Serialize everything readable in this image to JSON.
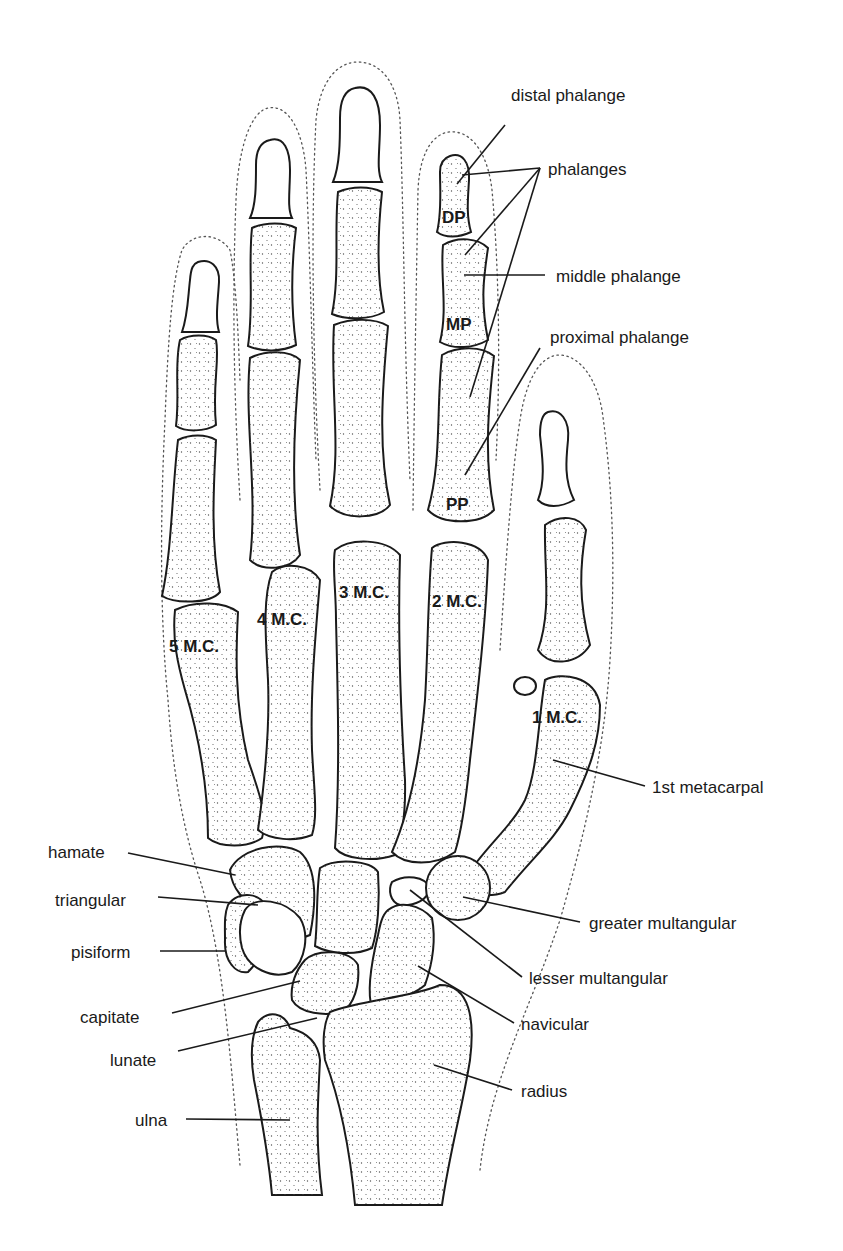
{
  "figure": {
    "ink_color": "#1a1a1a",
    "background": "#ffffff"
  },
  "labels": {
    "distal_phalange": "distal phalange",
    "phalanges": "phalanges",
    "middle_phalange": "middle phalange",
    "proximal_phalange": "proximal phalange",
    "first_metacarpal": "1st metacarpal",
    "hamate": "hamate",
    "triangular": "triangular",
    "pisiform": "pisiform",
    "capitate": "capitate",
    "lunate": "lunate",
    "ulna": "ulna",
    "greater_multangular": "greater multangular",
    "lesser_multangular": "lesser multangular",
    "navicular": "navicular",
    "radius": "radius"
  },
  "bone_labels": {
    "dp": "DP",
    "mp": "MP",
    "pp": "PP",
    "mc1": "1 M.C.",
    "mc2": "2 M.C.",
    "mc3": "3 M.C.",
    "mc4": "4 M.C.",
    "mc5": "5 M.C."
  }
}
